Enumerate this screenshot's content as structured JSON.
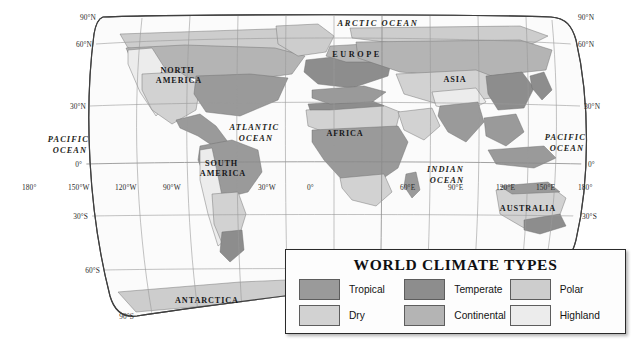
{
  "map": {
    "projection": "robinson",
    "background_color": "#ffffff",
    "graticule_color": "#9a9a9a",
    "outline_color": "#4a4a4a",
    "coastline_color": "#6e6e6e",
    "border_color": "#55555b",
    "latitude_labels_left": [
      {
        "text": "90°N",
        "lat": 90
      },
      {
        "text": "60°N",
        "lat": 60
      },
      {
        "text": "30°N",
        "lat": 30
      },
      {
        "text": "0°",
        "lat": 0
      },
      {
        "text": "30°S",
        "lat": -30
      },
      {
        "text": "60°S",
        "lat": -60
      },
      {
        "text": "90°S",
        "lat": -90
      }
    ],
    "latitude_labels_right": [
      {
        "text": "90°N",
        "lat": 90
      },
      {
        "text": "60°N",
        "lat": 60
      },
      {
        "text": "30°N",
        "lat": 30
      },
      {
        "text": "0°",
        "lat": 0
      },
      {
        "text": "30°S",
        "lat": -30
      }
    ],
    "longitude_labels": [
      {
        "text": "180°",
        "lon": -180
      },
      {
        "text": "150°W",
        "lon": -150
      },
      {
        "text": "120°W",
        "lon": -120
      },
      {
        "text": "90°W",
        "lon": -90
      },
      {
        "text": "30°W",
        "lon": -30
      },
      {
        "text": "0°",
        "lon": 0
      },
      {
        "text": "60°E",
        "lon": 60
      },
      {
        "text": "90°E",
        "lon": 90
      },
      {
        "text": "120°E",
        "lon": 120
      },
      {
        "text": "150°E",
        "lon": 150
      },
      {
        "text": "180°",
        "lon": 180
      }
    ],
    "continent_labels": [
      {
        "name": "north-america",
        "lines": [
          "NORTH",
          "AMERICA"
        ],
        "x": 179,
        "y": 73
      },
      {
        "name": "south-america",
        "lines": [
          "SOUTH",
          "AMERICA"
        ],
        "x": 223,
        "y": 166
      },
      {
        "name": "europe",
        "lines": [
          "EUROPE"
        ],
        "x": 357,
        "y": 57,
        "wide": true
      },
      {
        "name": "asia",
        "lines": [
          "ASIA"
        ],
        "x": 455,
        "y": 82
      },
      {
        "name": "africa",
        "lines": [
          "AFRICA"
        ],
        "x": 345,
        "y": 136
      },
      {
        "name": "australia",
        "lines": [
          "AUSTRALIA"
        ],
        "x": 528,
        "y": 211
      },
      {
        "name": "antarctica",
        "lines": [
          "ANTARCTICA"
        ],
        "x": 207,
        "y": 303
      }
    ],
    "ocean_labels": [
      {
        "name": "arctic-ocean",
        "lines": [
          "ARCTIC  OCEAN"
        ],
        "x": 378,
        "y": 24
      },
      {
        "name": "atlantic-ocean",
        "lines": [
          "ATLANTIC",
          "OCEAN"
        ],
        "x": 256,
        "y": 130
      },
      {
        "name": "pacific-ocean-west",
        "lines": [
          "PACIFIC",
          "OCEAN"
        ],
        "x": 70,
        "y": 142
      },
      {
        "name": "pacific-ocean-east",
        "lines": [
          "PACIFIC",
          "OCEAN"
        ],
        "x": 567,
        "y": 140
      },
      {
        "name": "indian-ocean",
        "lines": [
          "INDIAN",
          "OCEAN"
        ],
        "x": 447,
        "y": 172
      }
    ]
  },
  "legend": {
    "title": "WORLD CLIMATE TYPES",
    "items": [
      {
        "label": "Tropical",
        "color": "#9a9a9a"
      },
      {
        "label": "Temperate",
        "color": "#8d8d8d"
      },
      {
        "label": "Polar",
        "color": "#cdcdcd"
      },
      {
        "label": "Dry",
        "color": "#d2d2d2"
      },
      {
        "label": "Continental",
        "color": "#b4b4b4"
      },
      {
        "label": "Highland",
        "color": "#ececec"
      }
    ]
  }
}
